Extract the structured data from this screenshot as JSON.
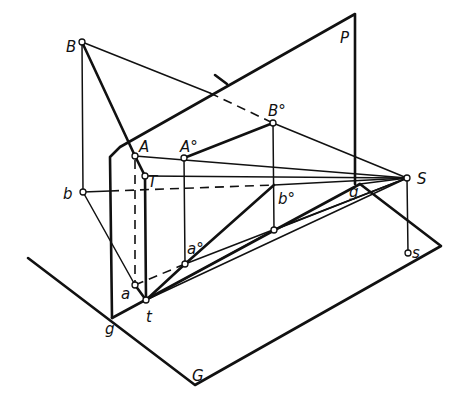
{
  "diagram": {
    "type": "perspective-construction",
    "labels": {
      "B": "B",
      "b": "b",
      "A": "A",
      "T": "T",
      "A0": "A°",
      "B0": "B°",
      "b0": "b°",
      "a0": "a°",
      "a": "a",
      "t": "t",
      "g_left": "g",
      "g_right": "g",
      "S": "S",
      "s": "s",
      "P": "P",
      "G": "G"
    },
    "planes": {
      "picture_plane": "P",
      "ground_plane": "G"
    },
    "points": [
      "B",
      "b",
      "A",
      "T",
      "A°",
      "B°",
      "b°",
      "a°",
      "a",
      "t",
      "S",
      "s",
      "g"
    ]
  }
}
